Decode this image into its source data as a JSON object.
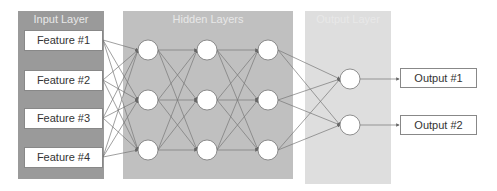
{
  "diagram": {
    "type": "neural-network",
    "panels": {
      "input": {
        "title": "Input Layer",
        "color": "#9a9a9a"
      },
      "hidden": {
        "title": "Hidden Layers",
        "color": "#c0c0c0"
      },
      "output": {
        "title": "Output Layer",
        "color": "#dedede"
      }
    },
    "inputs": [
      "Feature #1",
      "Feature #2",
      "Feature #3",
      "Feature #4"
    ],
    "hidden_layers": [
      3,
      3,
      3
    ],
    "output_nodes": 2,
    "outputs": [
      "Output #1",
      "Output #2"
    ]
  }
}
